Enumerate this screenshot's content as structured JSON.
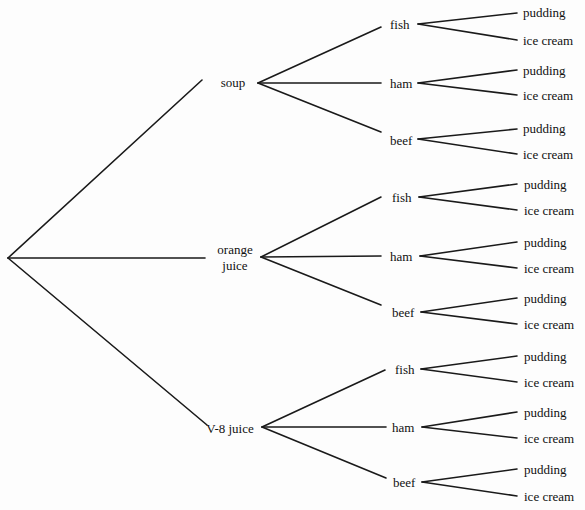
{
  "diagram": {
    "type": "tree",
    "root": {
      "x": 8,
      "y": 258
    },
    "level1": [
      {
        "label": "soup",
        "line_end": [
          202,
          80
        ],
        "label_pos": [
          233,
          82
        ],
        "origin": [
          258,
          83
        ],
        "children": [
          {
            "label": "fish",
            "end": [
              381,
              27
            ],
            "label_pos": [
              390,
              24
            ],
            "origin": [
              418,
              24
            ],
            "children": [
              {
                "label": "pudding",
                "end": [
                  517,
                  13
                ],
                "label_pos": [
                  523,
                  12
                ]
              },
              {
                "label": "ice cream",
                "end": [
                  517,
                  40
                ],
                "label_pos": [
                  523,
                  40
                ]
              }
            ]
          },
          {
            "label": "ham",
            "end": [
              381,
              83
            ],
            "label_pos": [
              390,
              83
            ],
            "origin": [
              418,
              83
            ],
            "children": [
              {
                "label": "pudding",
                "end": [
                  517,
                  70
                ],
                "label_pos": [
                  523,
                  70
                ]
              },
              {
                "label": "ice cream",
                "end": [
                  517,
                  95
                ],
                "label_pos": [
                  523,
                  95
                ]
              }
            ]
          },
          {
            "label": "beef",
            "end": [
              381,
              132
            ],
            "label_pos": [
              390,
              140
            ],
            "origin": [
              418,
              139
            ],
            "children": [
              {
                "label": "pudding",
                "end": [
                  517,
                  129
                ],
                "label_pos": [
                  523,
                  128
                ]
              },
              {
                "label": "ice cream",
                "end": [
                  517,
                  154
                ],
                "label_pos": [
                  523,
                  154
                ]
              }
            ]
          }
        ]
      },
      {
        "label_line1": "orange",
        "label_line2": "juice",
        "line_end": [
          205,
          258
        ],
        "label_pos": [
          235,
          258
        ],
        "origin": [
          261,
          257
        ],
        "children": [
          {
            "label": "fish",
            "end": [
              381,
              197
            ],
            "label_pos": [
              392,
              197
            ],
            "origin": [
              419,
              197
            ],
            "children": [
              {
                "label": "pudding",
                "end": [
                  517,
                  184
                ],
                "label_pos": [
                  524,
                  184
                ]
              },
              {
                "label": "ice cream",
                "end": [
                  517,
                  210
                ],
                "label_pos": [
                  524,
                  210
                ]
              }
            ]
          },
          {
            "label": "ham",
            "end": [
              381,
              256
            ],
            "label_pos": [
              390,
              256
            ],
            "origin": [
              420,
              256
            ],
            "children": [
              {
                "label": "pudding",
                "end": [
                  517,
                  242
                ],
                "label_pos": [
                  524,
                  242
                ]
              },
              {
                "label": "ice cream",
                "end": [
                  517,
                  268
                ],
                "label_pos": [
                  524,
                  268
                ]
              }
            ]
          },
          {
            "label": "beef",
            "end": [
              381,
              305
            ],
            "label_pos": [
              392,
              312
            ],
            "origin": [
              421,
              312
            ],
            "children": [
              {
                "label": "pudding",
                "end": [
                  517,
                  298
                ],
                "label_pos": [
                  524,
                  298
                ]
              },
              {
                "label": "ice cream",
                "end": [
                  517,
                  324
                ],
                "label_pos": [
                  524,
                  324
                ]
              }
            ]
          }
        ]
      },
      {
        "label": "V-8 juice",
        "line_end": [
          207,
          425
        ],
        "label_pos": [
          230,
          428
        ],
        "origin": [
          262,
          427
        ],
        "children": [
          {
            "label": "fish",
            "end": [
              385,
              370
            ],
            "label_pos": [
              395,
              369
            ],
            "origin": [
              421,
              369
            ],
            "children": [
              {
                "label": "pudding",
                "end": [
                  517,
                  356
                ],
                "label_pos": [
                  524,
                  356
                ]
              },
              {
                "label": "ice cream",
                "end": [
                  517,
                  382
                ],
                "label_pos": [
                  524,
                  382
                ]
              }
            ]
          },
          {
            "label": "ham",
            "end": [
              386,
              427
            ],
            "label_pos": [
              392,
              427
            ],
            "origin": [
              422,
              427
            ],
            "children": [
              {
                "label": "pudding",
                "end": [
                  517,
                  412
                ],
                "label_pos": [
                  524,
                  412
                ]
              },
              {
                "label": "ice cream",
                "end": [
                  517,
                  438
                ],
                "label_pos": [
                  524,
                  438
                ]
              }
            ]
          },
          {
            "label": "beef",
            "end": [
              386,
              478
            ],
            "label_pos": [
              393,
              482
            ],
            "origin": [
              422,
              482
            ],
            "children": [
              {
                "label": "pudding",
                "end": [
                  517,
                  469
                ],
                "label_pos": [
                  524,
                  469
                ]
              },
              {
                "label": "ice cream",
                "end": [
                  517,
                  496
                ],
                "label_pos": [
                  524,
                  496
                ]
              }
            ]
          }
        ]
      }
    ]
  },
  "labels": {
    "soup": "soup",
    "orange": "orange",
    "juice": "juice",
    "v8": "V-8 juice",
    "fish": "fish",
    "ham": "ham",
    "beef": "beef",
    "pudding": "pudding",
    "ice_cream": "ice cream"
  }
}
